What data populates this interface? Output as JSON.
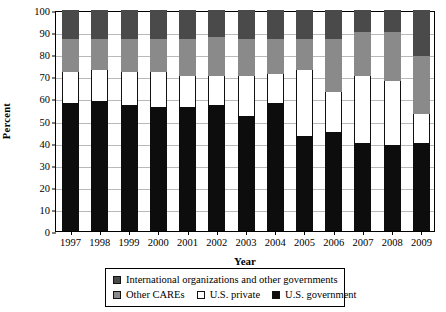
{
  "chart_data": {
    "type": "bar",
    "stacked": true,
    "title": "",
    "xlabel": "Year",
    "ylabel": "Percent",
    "ylim": [
      0,
      100
    ],
    "ytick_step": 10,
    "yticks": [
      0,
      10,
      20,
      30,
      40,
      50,
      60,
      70,
      80,
      90,
      100
    ],
    "grid": true,
    "legend_position": "bottom",
    "categories": [
      "1997",
      "1998",
      "1999",
      "2000",
      "2001",
      "2002",
      "2003",
      "2004",
      "2005",
      "2006",
      "2007",
      "2008",
      "2009"
    ],
    "series": [
      {
        "name": "U.S. government",
        "color": "#0d0d0d",
        "values": [
          58,
          59,
          57,
          56,
          56,
          57,
          52,
          58,
          43,
          45,
          40,
          39,
          40
        ]
      },
      {
        "name": "U.S. private",
        "color": "#ffffff",
        "values": [
          14,
          14,
          15,
          16,
          14,
          13,
          18,
          13,
          30,
          18,
          30,
          29,
          13
        ]
      },
      {
        "name": "Other CAREs",
        "color": "#8a8a8a",
        "values": [
          15,
          14,
          15,
          15,
          17,
          18,
          17,
          16,
          14,
          24,
          20,
          22,
          26
        ]
      },
      {
        "name": "International organizations and other governments",
        "color": "#4a4a4a",
        "values": [
          13,
          13,
          13,
          13,
          13,
          12,
          13,
          13,
          13,
          13,
          10,
          10,
          21
        ]
      }
    ]
  },
  "axis": {
    "ylabel": "Percent",
    "xlabel": "Year"
  },
  "legend": {
    "row1": [
      {
        "label": "International organizations and other governments",
        "swatch": "intl-swatch"
      }
    ],
    "row2": [
      {
        "label": "Other CAREs",
        "swatch": "care-swatch"
      },
      {
        "label": "U.S. private",
        "swatch": "private-swatch"
      },
      {
        "label": "U.S. government",
        "swatch": "government-swatch"
      }
    ]
  }
}
